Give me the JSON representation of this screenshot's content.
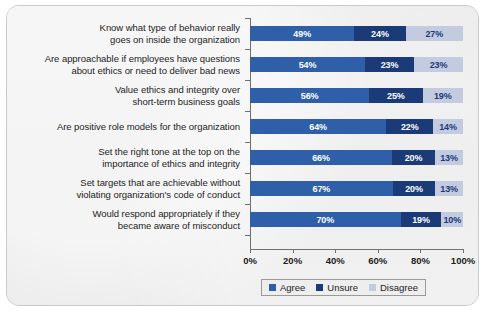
{
  "chart_data": {
    "type": "bar",
    "subtype": "stacked-horizontal-100pct",
    "title": "",
    "xlabel": "",
    "ylabel": "",
    "xlim": [
      0,
      100
    ],
    "xticks": [
      "0%",
      "20%",
      "40%",
      "60%",
      "80%",
      "100%"
    ],
    "grid": false,
    "legend_position": "bottom",
    "categories": [
      [
        "Know what type of behavior really",
        "goes on inside the organization"
      ],
      [
        "Are approachable if employees have questions",
        "about ethics or need to deliver bad news"
      ],
      [
        "Value ethics and integrity over",
        "short-term business goals"
      ],
      [
        "Are positive role models for the organization"
      ],
      [
        "Set the right tone at the top on the",
        "importance of ethics and integrity"
      ],
      [
        "Set targets that are achievable without",
        "violating organization's code of conduct"
      ],
      [
        "Would respond appropriately if they",
        "became aware of misconduct"
      ]
    ],
    "series": [
      {
        "name": "Agree",
        "color": "#2e5fa8",
        "values": [
          49,
          54,
          56,
          64,
          66,
          67,
          70
        ],
        "labels": [
          "49%",
          "54%",
          "56%",
          "64%",
          "66%",
          "67%",
          "70%"
        ]
      },
      {
        "name": "Unsure",
        "color": "#1b3a78",
        "values": [
          24,
          23,
          25,
          22,
          20,
          20,
          19
        ],
        "labels": [
          "24%",
          "23%",
          "25%",
          "22%",
          "20%",
          "20%",
          "19%"
        ]
      },
      {
        "name": "Disagree",
        "color": "#c3cbe0",
        "values": [
          27,
          23,
          19,
          14,
          13,
          13,
          10
        ],
        "labels": [
          "27%",
          "23%",
          "19%",
          "14%",
          "13%",
          "13%",
          "10%"
        ]
      }
    ]
  },
  "legend": {
    "items": [
      {
        "label": "Agree"
      },
      {
        "label": "Unsure"
      },
      {
        "label": "Disagree"
      }
    ]
  }
}
